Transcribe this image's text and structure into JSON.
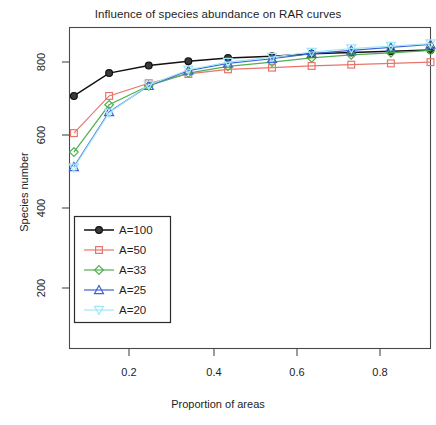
{
  "chart_data": {
    "type": "line",
    "title": "Influence of species abundance on RAR curves",
    "xlabel": "Proportion of areas",
    "ylabel": "Species number",
    "xlim": [
      0.09,
      0.91
    ],
    "ylim": [
      120,
      880
    ],
    "xticks": [
      "0.2",
      "0.4",
      "0.6",
      "0.8"
    ],
    "xtick_values": [
      0.2,
      0.4,
      0.6,
      0.8
    ],
    "yticks": [
      "200",
      "400",
      "600",
      "800"
    ],
    "ytick_values": [
      200,
      400,
      600,
      800
    ],
    "grid": false,
    "legend_position": "lower-left",
    "x": [
      0.1,
      0.18,
      0.27,
      0.36,
      0.45,
      0.55,
      0.64,
      0.73,
      0.82,
      0.91
    ],
    "series": [
      {
        "name": "A=100",
        "label": "A=100",
        "color": "#111111",
        "marker": "circle",
        "values": [
          718,
          772,
          790,
          800,
          808,
          812,
          818,
          821,
          824,
          827
        ]
      },
      {
        "name": "A=50",
        "label": "A=50",
        "color": "#e8756b",
        "marker": "square",
        "values": [
          630,
          718,
          748,
          770,
          781,
          785,
          789,
          792,
          795,
          798
        ]
      },
      {
        "name": "A=33",
        "label": "A=33",
        "color": "#4fb050",
        "marker": "diamond",
        "values": [
          585,
          697,
          742,
          772,
          788,
          798,
          808,
          815,
          820,
          826
        ]
      },
      {
        "name": "A=25",
        "label": "A=25",
        "color": "#3f63d8",
        "marker": "triangle-up",
        "values": [
          550,
          680,
          742,
          778,
          795,
          806,
          818,
          826,
          833,
          840
        ]
      },
      {
        "name": "A=20",
        "label": "A=20",
        "color": "#9fe8f5",
        "marker": "triangle-down",
        "values": [
          548,
          678,
          744,
          780,
          798,
          810,
          822,
          830,
          836,
          842
        ]
      }
    ]
  },
  "legend": {
    "entries": [
      {
        "label": "A=100"
      },
      {
        "label": "A=50"
      },
      {
        "label": "A=33"
      },
      {
        "label": "A=25"
      },
      {
        "label": "A=20"
      }
    ]
  }
}
